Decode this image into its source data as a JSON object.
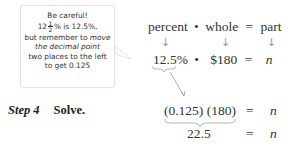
{
  "callout": {
    "line1": "Be careful!",
    "line2_whole": "12",
    "line2_frac_num": "1",
    "line2_frac_den": "2",
    "line2_rest": "% is 12.5%,",
    "line3_a": "but remember to ",
    "line3_b": "move",
    "line4": "the decimal point",
    "line5": "two places to the left",
    "line6": "to get 0.125"
  },
  "formula": {
    "percent": "percent",
    "dot1": "•",
    "whole": "whole",
    "eq": "=",
    "part": "part",
    "arrow_glyph": "↓"
  },
  "substitution": {
    "percent_value": "12.5%",
    "dot": "•",
    "whole_value": "$180",
    "eq": "=",
    "variable": "n"
  },
  "step": {
    "label": "Step 4",
    "action": "Solve."
  },
  "solve_lines": [
    {
      "lhs": "(0.125) (180)",
      "eq": "=",
      "rhs": "n"
    },
    {
      "lhs": "22.5",
      "eq": "=",
      "rhs": "n"
    }
  ]
}
